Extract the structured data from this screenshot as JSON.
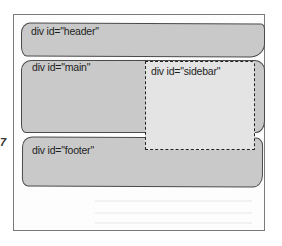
{
  "diagram": {
    "type": "page-layout-wireframe",
    "frame": {
      "border_color": "#7a7a7a",
      "background": "#ffffff"
    },
    "regions": [
      {
        "id": "header",
        "label": "div id=\"header\"",
        "style": "solid",
        "fill": "#c9c9c9"
      },
      {
        "id": "main",
        "label": "div id=\"main\"",
        "style": "solid",
        "fill": "#c9c9c9"
      },
      {
        "id": "sidebar",
        "label": "div id=\"sidebar\"",
        "style": "dashed",
        "fill": "#e4e4e4"
      },
      {
        "id": "footer",
        "label": "div id=\"footer\"",
        "style": "solid",
        "fill": "#c9c9c9"
      }
    ],
    "margin_mark": "7"
  }
}
